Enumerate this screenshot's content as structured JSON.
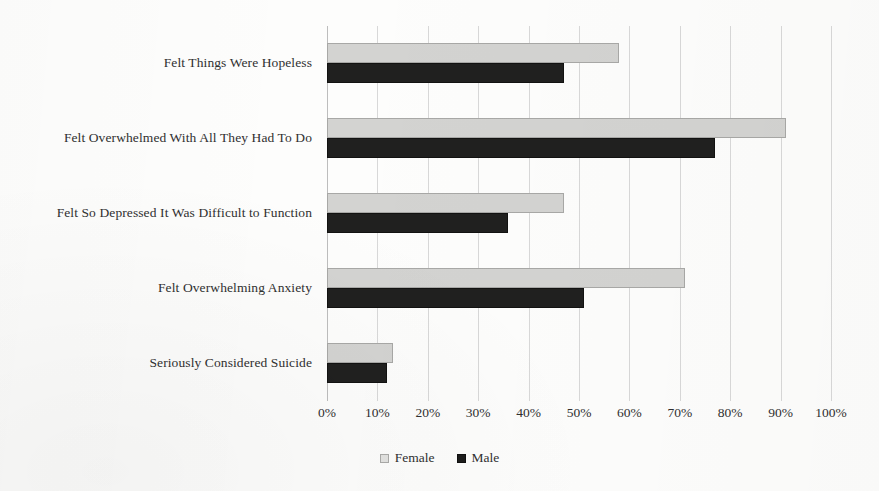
{
  "chart_data": {
    "type": "bar",
    "orientation": "horizontal",
    "title": "",
    "xlabel": "",
    "ylabel": "",
    "xlim": [
      0,
      100
    ],
    "grid": true,
    "legend_position": "bottom",
    "categories": [
      "Felt Things Were Hopeless",
      "Felt Overwhelmed With All They Had To Do",
      "Felt So Depressed It Was Difficult to Function",
      "Felt Overwhelming Anxiety",
      "Seriously Considered Suicide"
    ],
    "series": [
      {
        "name": "Female",
        "color": "#d3d3d1",
        "values": [
          58,
          91,
          47,
          71,
          13
        ]
      },
      {
        "name": "Male",
        "color": "#20201f",
        "values": [
          47,
          77,
          36,
          51,
          12
        ]
      }
    ],
    "xticks": [
      0,
      10,
      20,
      30,
      40,
      50,
      60,
      70,
      80,
      90,
      100
    ],
    "xtick_labels": [
      "0%",
      "10%",
      "20%",
      "30%",
      "40%",
      "50%",
      "60%",
      "70%",
      "80%",
      "90%",
      "100%"
    ]
  },
  "legend": {
    "items": [
      {
        "label": "Female",
        "swatch": "square-light-icon"
      },
      {
        "label": "Male",
        "swatch": "square-dark-icon"
      }
    ]
  }
}
